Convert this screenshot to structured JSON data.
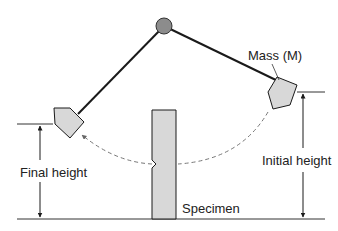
{
  "diagram": {
    "labels": {
      "mass": "Mass (M)",
      "final_height": "Final height",
      "initial_height": "Initial height",
      "specimen": "Specimen"
    },
    "colors": {
      "line": "#1a1a1a",
      "fill": "#d8d8d8",
      "pivot": "#8c8c8c",
      "dashed": "#777777"
    }
  }
}
